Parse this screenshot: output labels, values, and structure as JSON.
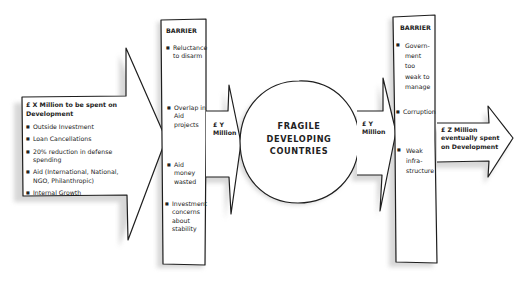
{
  "source_box": {
    "title": "£ X Million to be spent on Development",
    "items": [
      "Outside Investment",
      "Loan Cancellations",
      "20% reduction in defense spending",
      "Aid (International, National, NGO, Philanthropic)",
      "Internal Growth"
    ]
  },
  "barrier_1": {
    "title": "BARRIER",
    "items": [
      "Reluctance to disarm",
      "Overlap in Aid projects",
      "Aid money wasted",
      "Investment concerns about stability"
    ]
  },
  "flow_1": {
    "line1": "£ Y",
    "line2": "Million"
  },
  "center": {
    "line1": "FRAGILE",
    "line2": "DEVELOPING",
    "line3": "COUNTRIES"
  },
  "flow_2": {
    "line1": "£ Y",
    "line2": "Million"
  },
  "barrier_2": {
    "title": "BARRIER",
    "items": [
      "Govern- ment too weak to manage",
      "Corruption",
      "Weak infra- structure"
    ]
  },
  "outcome": {
    "line1": "£ Z Million",
    "line2": "eventually spent",
    "line3": "on Development"
  }
}
